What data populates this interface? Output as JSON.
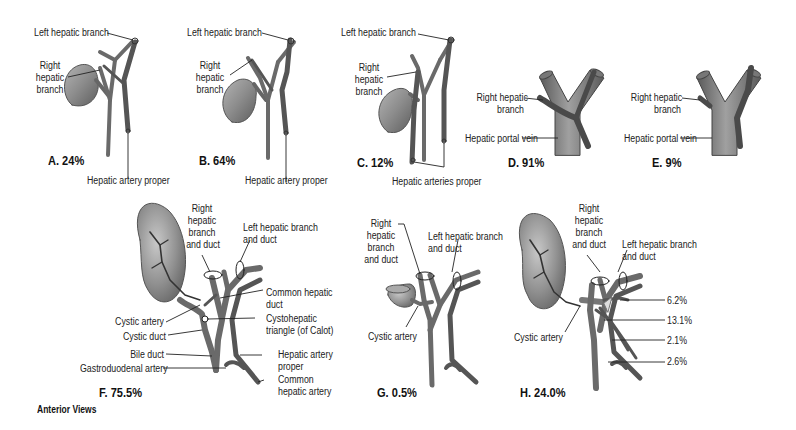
{
  "figure": {
    "view_note": "Anterior Views",
    "colors": {
      "vessel": "#6e6e6e",
      "vessel_dark": "#4a4a4a",
      "gallbladder": "#8a8a8a",
      "leader": "#222222"
    }
  },
  "panels": [
    {
      "id": "A",
      "caption": "A. 24%",
      "labels": {
        "left_hepatic": "Left hepatic branch",
        "right_hepatic": [
          "Right",
          "hepatic",
          "branch"
        ],
        "artery": "Hepatic artery proper"
      }
    },
    {
      "id": "B",
      "caption": "B. 64%",
      "labels": {
        "left_hepatic": "Left hepatic branch",
        "right_hepatic": [
          "Right",
          "hepatic",
          "branch"
        ],
        "artery": "Hepatic artery proper"
      }
    },
    {
      "id": "C",
      "caption": "C. 12%",
      "labels": {
        "left_hepatic": "Left hepatic branch",
        "right_hepatic": [
          "Right",
          "hepatic",
          "branch"
        ],
        "artery": "Hepatic arteries proper"
      }
    },
    {
      "id": "D",
      "caption": "D. 91%",
      "labels": {
        "right_hepatic": [
          "Right hepatic",
          "branch"
        ],
        "portal": "Hepatic portal vein"
      }
    },
    {
      "id": "E",
      "caption": "E. 9%",
      "labels": {
        "right_hepatic": [
          "Right hepatic",
          "branch"
        ],
        "portal": "Hepatic portal vein"
      }
    },
    {
      "id": "F",
      "caption": "F. 75.5%",
      "labels": {
        "right_hepatic_duct": [
          "Right",
          "hepatic",
          "branch",
          "and duct"
        ],
        "left_hepatic_duct": [
          "Left hepatic branch",
          "and duct"
        ],
        "common_hepatic_duct": [
          "Common hepatic",
          "duct"
        ],
        "cystohepatic": [
          "Cystohepatic",
          "triangle (of Calot)"
        ],
        "cystic_artery": "Cystic artery",
        "cystic_duct": "Cystic duct",
        "bile_duct": "Bile duct",
        "gastroduodenal": "Gastroduodenal artery",
        "hepatic_artery_proper": [
          "Hepatic artery",
          "proper"
        ],
        "common_hepatic_artery": [
          "Common",
          "hepatic artery"
        ]
      }
    },
    {
      "id": "G",
      "caption": "G. 0.5%",
      "labels": {
        "right_hepatic_duct": [
          "Right",
          "hepatic",
          "branch",
          "and duct"
        ],
        "left_hepatic_duct": [
          "Left hepatic branch",
          "and duct"
        ],
        "cystic_artery": "Cystic artery"
      }
    },
    {
      "id": "H",
      "caption": "H. 24.0%",
      "labels": {
        "right_hepatic_duct": [
          "Right",
          "hepatic",
          "branch",
          "and duct"
        ],
        "left_hepatic_duct": [
          "Left hepatic branch",
          "and duct"
        ],
        "cystic_artery": "Cystic artery",
        "pct": [
          "6.2%",
          "13.1%",
          "2.1%",
          "2.6%"
        ]
      }
    }
  ]
}
